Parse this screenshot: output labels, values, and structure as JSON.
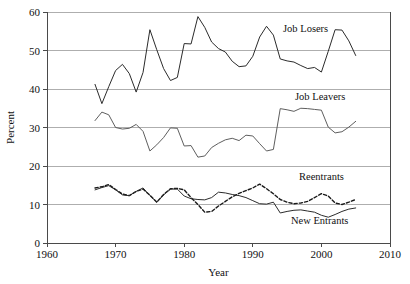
{
  "chart_data": {
    "type": "line",
    "title": "",
    "xlabel": "Year",
    "ylabel": "Percent",
    "xlim": [
      1960,
      2010
    ],
    "ylim": [
      0,
      60
    ],
    "xticks": [
      "1960",
      "1970",
      "1980",
      "1990",
      "2000",
      "2010"
    ],
    "yticks": [
      "0",
      "10",
      "20",
      "30",
      "40",
      "50",
      "60"
    ],
    "grid": "horizontal",
    "legend_position": "inline-annotations",
    "series": [
      {
        "name": "Job Losers",
        "style": "solid",
        "color": "#2b2b2b",
        "label_text": "Job Losers",
        "x": [
          1967,
          1968,
          1969,
          1970,
          1971,
          1972,
          1973,
          1974,
          1975,
          1976,
          1977,
          1978,
          1979,
          1980,
          1981,
          1982,
          1983,
          1984,
          1985,
          1986,
          1987,
          1988,
          1989,
          1990,
          1991,
          1992,
          1993,
          1994,
          1995,
          1996,
          1997,
          1998,
          1999,
          2000,
          2001,
          2002,
          2003,
          2004,
          2005
        ],
        "values": [
          41.2,
          36.2,
          40.6,
          44.8,
          46.4,
          44.0,
          39.2,
          44.3,
          55.4,
          50.2,
          45.3,
          42.2,
          43.0,
          51.8,
          51.7,
          58.8,
          56.0,
          52.2,
          50.5,
          49.6,
          47.2,
          45.8,
          46.0,
          48.5,
          53.5,
          56.3,
          54.0,
          47.8,
          47.3,
          47.0,
          46.1,
          45.3,
          45.6,
          44.4,
          49.8,
          55.4,
          55.3,
          52.5,
          48.7
        ]
      },
      {
        "name": "Job Leavers",
        "style": "solid",
        "color": "#555555",
        "label_text": "Job Leavers",
        "x": [
          1967,
          1968,
          1969,
          1970,
          1971,
          1972,
          1973,
          1974,
          1975,
          1976,
          1977,
          1978,
          1979,
          1980,
          1981,
          1982,
          1983,
          1984,
          1985,
          1986,
          1987,
          1988,
          1989,
          1990,
          1991,
          1992,
          1993,
          1994,
          1995,
          1996,
          1997,
          1998,
          1999,
          2000,
          2001,
          2002,
          2003,
          2004,
          2005
        ],
        "values": [
          31.8,
          34.0,
          33.3,
          30.0,
          29.6,
          29.8,
          30.8,
          29.0,
          23.9,
          25.5,
          27.4,
          29.9,
          29.8,
          25.2,
          25.3,
          22.3,
          22.6,
          24.8,
          25.9,
          26.8,
          27.2,
          26.6,
          28.0,
          27.8,
          25.8,
          23.9,
          24.3,
          34.9,
          34.6,
          34.2,
          35.0,
          34.9,
          34.7,
          34.5,
          30.1,
          28.6,
          28.9,
          30.1,
          31.6
        ]
      },
      {
        "name": "Reentrants",
        "style": "dashed",
        "color": "#1a1a1a",
        "label_text": "Reentrants",
        "x": [
          1967,
          1968,
          1969,
          1970,
          1971,
          1972,
          1973,
          1974,
          1975,
          1976,
          1977,
          1978,
          1979,
          1980,
          1981,
          1982,
          1983,
          1984,
          1985,
          1986,
          1987,
          1988,
          1989,
          1990,
          1991,
          1992,
          1993,
          1994,
          1995,
          1996,
          1997,
          1998,
          1999,
          2000,
          2001,
          2002,
          2003,
          2004,
          2005
        ],
        "values": [
          14.3,
          14.6,
          15.2,
          13.9,
          12.7,
          12.3,
          13.4,
          14.0,
          12.4,
          10.6,
          12.6,
          14.1,
          14.2,
          13.8,
          11.8,
          10.0,
          8.0,
          8.2,
          9.6,
          10.8,
          12.0,
          12.9,
          13.6,
          14.3,
          15.3,
          14.1,
          12.8,
          11.3,
          10.6,
          10.2,
          10.4,
          10.8,
          11.8,
          12.8,
          12.2,
          10.4,
          10.0,
          10.6,
          11.3
        ]
      },
      {
        "name": "New Entrants",
        "style": "solid",
        "color": "#2b2b2b",
        "label_text": "New Entrants",
        "x": [
          1967,
          1968,
          1969,
          1970,
          1971,
          1972,
          1973,
          1974,
          1975,
          1976,
          1977,
          1978,
          1979,
          1980,
          1981,
          1982,
          1983,
          1984,
          1985,
          1986,
          1987,
          1988,
          1989,
          1990,
          1991,
          1992,
          1993,
          1994,
          1995,
          1996,
          1997,
          1998,
          1999,
          2000,
          2001,
          2002,
          2003,
          2004,
          2005
        ],
        "values": [
          13.8,
          14.4,
          14.9,
          13.8,
          12.5,
          12.3,
          13.4,
          14.3,
          12.3,
          10.6,
          12.5,
          14.0,
          14.0,
          12.2,
          11.5,
          11.3,
          11.2,
          11.8,
          13.2,
          13.0,
          12.6,
          12.3,
          11.8,
          11.0,
          10.2,
          10.1,
          10.6,
          7.8,
          8.2,
          8.5,
          8.6,
          8.3,
          8.0,
          7.2,
          6.7,
          7.4,
          8.2,
          8.8,
          9.1
        ]
      }
    ]
  },
  "annotations": [
    {
      "name": "job-losers-label",
      "text": "Job Losers",
      "x": 283,
      "y": 32
    },
    {
      "name": "job-leavers-label",
      "text": "Job Leavers",
      "x": 295,
      "y": 100
    },
    {
      "name": "reentrants-label",
      "text": "Reentrants",
      "x": 299,
      "y": 180
    },
    {
      "name": "new-entrants-label",
      "text": "New Entrants",
      "x": 291,
      "y": 224
    }
  ],
  "axes": {
    "y_title": "Percent",
    "x_title": "Year"
  },
  "top_clipped_text": "· · · · · · · ·"
}
